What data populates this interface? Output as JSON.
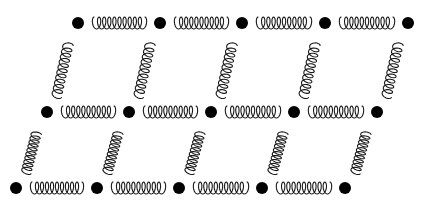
{
  "diagram": {
    "title": "",
    "colors": {
      "background": "#ffffff",
      "mass": "#000000",
      "spring": "#1a1a1a"
    },
    "mass_radius": 6,
    "rows": [
      {
        "y": 23,
        "x": [
          78,
          160,
          242,
          325,
          408
        ]
      },
      {
        "y": 112,
        "x": [
          47,
          129,
          211,
          294,
          377
        ]
      },
      {
        "y": 188,
        "x": [
          16,
          97,
          179,
          262,
          345
        ]
      }
    ],
    "horizontal_spring": {
      "coils": 10,
      "amplitude": 6
    },
    "diagonal_spring": {
      "coils": 10,
      "amplitude": 5
    }
  }
}
